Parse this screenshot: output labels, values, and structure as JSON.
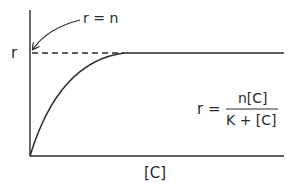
{
  "diagram": {
    "type": "saturation-curve",
    "y_axis_label": "r",
    "x_axis_label": "[C]",
    "asymptote_annotation": "r = n",
    "equation": {
      "lhs": "r =",
      "numerator": "n[C]",
      "denominator": "K + [C]"
    },
    "colors": {
      "line": "#2a2a2a",
      "background": "#ffffff"
    }
  }
}
